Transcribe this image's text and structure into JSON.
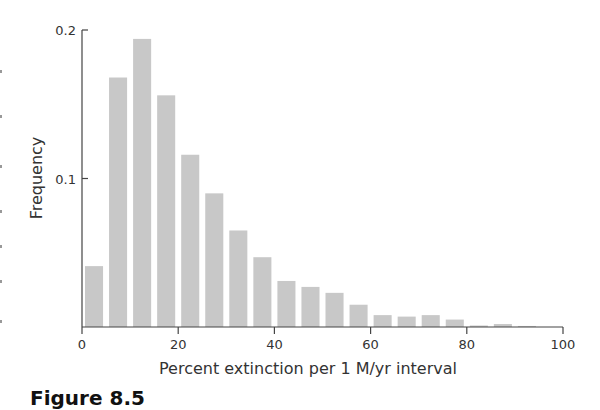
{
  "chart_data": {
    "type": "bar",
    "title": "",
    "xlabel": "Percent extinction per 1 M/yr interval",
    "ylabel": "Frequency",
    "xlim": [
      0,
      100
    ],
    "ylim": [
      0,
      0.2
    ],
    "x_ticks": [
      "0",
      "20",
      "40",
      "60",
      "80",
      "100"
    ],
    "y_ticks": [
      "0.1",
      "0.2"
    ],
    "bin_width": 5,
    "categories": [
      "0-5",
      "5-10",
      "10-15",
      "15-20",
      "20-25",
      "25-30",
      "30-35",
      "35-40",
      "40-45",
      "45-50",
      "50-55",
      "55-60",
      "60-65",
      "65-70",
      "70-75",
      "75-80",
      "80-85",
      "85-90",
      "90-95"
    ],
    "bin_starts": [
      0,
      5,
      10,
      15,
      20,
      25,
      30,
      35,
      40,
      45,
      50,
      55,
      60,
      65,
      70,
      75,
      80,
      85,
      90
    ],
    "values": [
      0.041,
      0.168,
      0.194,
      0.156,
      0.116,
      0.09,
      0.065,
      0.047,
      0.031,
      0.027,
      0.023,
      0.015,
      0.008,
      0.007,
      0.008,
      0.005,
      0.001,
      0.002,
      0.0007
    ],
    "grid": false,
    "bar_color": "#c8c8c8"
  },
  "caption": "Figure 8.5"
}
